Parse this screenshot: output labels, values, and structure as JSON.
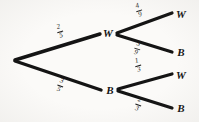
{
  "diagram": {
    "background_color": "#fbfaf8",
    "line_color": "#141414",
    "text_color": "#141414",
    "root": {
      "x": 14,
      "y": 60
    },
    "nodes": [
      {
        "id": "stage1-w",
        "label": "W",
        "x": 108,
        "y": 33
      },
      {
        "id": "stage1-b",
        "label": "B",
        "x": 110,
        "y": 90
      },
      {
        "id": "leaf-ww",
        "label": "W",
        "x": 181,
        "y": 14
      },
      {
        "id": "leaf-wb",
        "label": "B",
        "x": 181,
        "y": 52
      },
      {
        "id": "leaf-bw",
        "label": "W",
        "x": 181,
        "y": 75
      },
      {
        "id": "leaf-bb",
        "label": "B",
        "x": 181,
        "y": 108
      }
    ],
    "branches": [
      {
        "id": "root-to-w",
        "from": "root",
        "to": "stage1-w",
        "x1": 15,
        "y1": 60,
        "x2": 100,
        "y2": 34,
        "width": 3.4
      },
      {
        "id": "root-to-b",
        "from": "root",
        "to": "stage1-b",
        "x1": 15,
        "y1": 61,
        "x2": 101,
        "y2": 90,
        "width": 3.4
      },
      {
        "id": "w-to-w",
        "from": "stage1-w",
        "to": "leaf-ww",
        "x1": 117,
        "y1": 33,
        "x2": 172,
        "y2": 13,
        "width": 3.2
      },
      {
        "id": "w-to-b",
        "from": "stage1-w",
        "to": "leaf-wb",
        "x1": 117,
        "y1": 35,
        "x2": 172,
        "y2": 52,
        "width": 3.2
      },
      {
        "id": "b-to-w",
        "from": "stage1-b",
        "to": "leaf-bw",
        "x1": 118,
        "y1": 89,
        "x2": 172,
        "y2": 74,
        "width": 3.2
      },
      {
        "id": "b-to-b",
        "from": "stage1-b",
        "to": "leaf-bb",
        "x1": 118,
        "y1": 91,
        "x2": 172,
        "y2": 108,
        "width": 3.2
      }
    ],
    "probabilities": [
      {
        "id": "p-root-w",
        "branch": "root-to-w",
        "numerator": "2",
        "denominator": "5",
        "x": 60,
        "y": 32,
        "rotation": -17
      },
      {
        "id": "p-root-b",
        "branch": "root-to-b",
        "numerator": "3",
        "denominator": "5",
        "x": 60,
        "y": 86,
        "rotation": 19
      },
      {
        "id": "p-w-w",
        "branch": "w-to-w",
        "numerator": "4",
        "denominator": "9",
        "x": 139,
        "y": 11,
        "rotation": -19
      },
      {
        "id": "p-w-b",
        "branch": "w-to-b",
        "numerator": "5",
        "denominator": "9",
        "x": 137,
        "y": 49,
        "rotation": 17
      },
      {
        "id": "p-b-w",
        "branch": "b-to-w",
        "numerator": "1",
        "denominator": "3",
        "x": 138,
        "y": 66,
        "rotation": -15
      },
      {
        "id": "p-b-b",
        "branch": "b-to-b",
        "numerator": "2",
        "denominator": "3",
        "x": 138,
        "y": 105,
        "rotation": 18
      }
    ]
  }
}
